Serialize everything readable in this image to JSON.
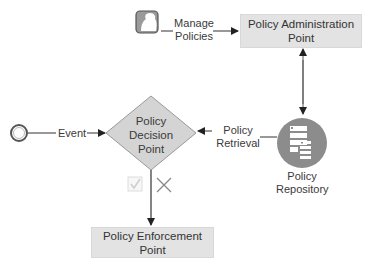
{
  "diagram": {
    "type": "policy-flow",
    "nodes": {
      "actor": {
        "label": "",
        "icon": "user-profile-icon"
      },
      "pap": {
        "label": "Policy Administration Point"
      },
      "pdp": {
        "label": "Policy Decision Point",
        "shape": "diamond"
      },
      "pep": {
        "label": "Policy Enforcement Point"
      },
      "repository": {
        "label": "Policy Repository",
        "icon": "database-servers-icon"
      },
      "start_event": {
        "shape": "circle"
      }
    },
    "edges": {
      "manage_policies": {
        "from": "actor",
        "to": "pap",
        "label": "Manage Policies"
      },
      "pap_repository": {
        "from": "pap",
        "to": "repository",
        "label": "",
        "bidirectional": true
      },
      "policy_retrieval": {
        "from": "repository",
        "to": "pdp",
        "label": "Policy Retrieval"
      },
      "event": {
        "from": "start_event",
        "to": "pdp",
        "label": "Event"
      },
      "decision": {
        "from": "pdp",
        "to": "pep",
        "label": "",
        "markers": [
          "check-icon",
          "cross-icon"
        ]
      }
    },
    "colors": {
      "box_fill": "#e3e3e3",
      "diamond_fill": "#d4d4d4",
      "repository_fill": "#8c8c8c",
      "line": "#333333"
    }
  }
}
